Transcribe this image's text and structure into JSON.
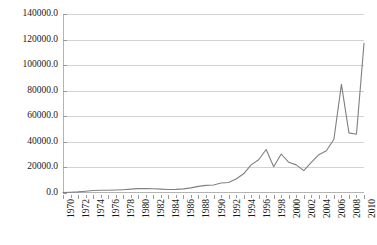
{
  "chart_data": {
    "type": "line",
    "title": "",
    "subtitle": "",
    "xlabel": "",
    "ylabel": "",
    "xlim": [
      1970,
      2010
    ],
    "ylim": [
      0,
      140000
    ],
    "grid": true,
    "legend": false,
    "legend_position": "none",
    "line_color": "#808080",
    "ytick_labels": [
      "0.0",
      "20000.0",
      "40000.0",
      "60000.0",
      "80000.0",
      "100000.0",
      "120000.0",
      "140000.0"
    ],
    "ytick_values": [
      0,
      20000,
      40000,
      60000,
      80000,
      100000,
      120000,
      140000
    ],
    "xtick_labels": [
      "1970",
      "1972",
      "1974",
      "1976",
      "1978",
      "1980",
      "1982",
      "1984",
      "1986",
      "1988",
      "1990",
      "1992",
      "1994",
      "1996",
      "1998",
      "2000",
      "2002",
      "2004",
      "2006",
      "2008",
      "2010"
    ],
    "xtick_values": [
      1970,
      1972,
      1974,
      1976,
      1978,
      1980,
      1982,
      1984,
      1986,
      1988,
      1990,
      1992,
      1994,
      1996,
      1998,
      2000,
      2002,
      2004,
      2006,
      2008,
      2010
    ],
    "x": [
      1970,
      1971,
      1972,
      1973,
      1974,
      1975,
      1976,
      1977,
      1978,
      1979,
      1980,
      1981,
      1982,
      1983,
      1984,
      1985,
      1986,
      1987,
      1988,
      1989,
      1990,
      1991,
      1992,
      1993,
      1994,
      1995,
      1996,
      1997,
      1998,
      1999,
      2000,
      2001,
      2002,
      2003,
      2004,
      2005,
      2006,
      2007,
      2008,
      2009,
      2010
    ],
    "values": [
      400,
      600,
      900,
      1400,
      2000,
      2200,
      2100,
      2300,
      2600,
      3000,
      3400,
      3500,
      3300,
      3000,
      2700,
      2800,
      3200,
      4000,
      5200,
      6000,
      6200,
      7800,
      8200,
      11000,
      15000,
      22000,
      26000,
      34000,
      20500,
      30500,
      24000,
      22000,
      17500,
      24000,
      30000,
      33000,
      42000,
      85000,
      47000,
      46000,
      117000
    ]
  }
}
